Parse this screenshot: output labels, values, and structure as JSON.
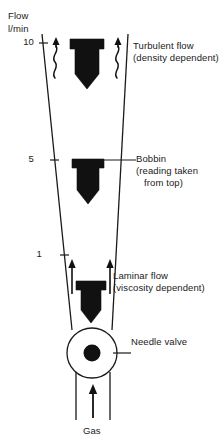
{
  "figure": {
    "type": "flowmeter-diagram",
    "title_axis": {
      "line1": "Flow",
      "line2": "l/min"
    },
    "scale": {
      "unit": "l/min",
      "ticks": [
        {
          "value": "10",
          "y": 43
        },
        {
          "value": "5",
          "y": 160
        },
        {
          "value": "1",
          "y": 255
        }
      ]
    },
    "annotations": {
      "turbulent": {
        "line1": "Turbulent flow",
        "line2": "(density dependent)"
      },
      "bobbin": {
        "line1": "Bobbin",
        "line2": "(reading taken",
        "line3": "from top)"
      },
      "laminar": {
        "line1": "Laminar flow",
        "line2": "(viscosity dependent)"
      },
      "needle_valve": {
        "line1": "Needle valve"
      },
      "gas": {
        "line1": "Gas"
      }
    },
    "components": {
      "tube": "tapered-glass-tube",
      "bobbin_top": "bobbin-turbulent-position",
      "bobbin_middle": "bobbin-mid-position",
      "bobbin_bottom": "bobbin-laminar-position",
      "valve": "needle-valve",
      "inlet": "gas-inlet"
    },
    "colors": {
      "ink": "#111111",
      "line": "#1a1a1a",
      "background": "#ffffff"
    }
  }
}
